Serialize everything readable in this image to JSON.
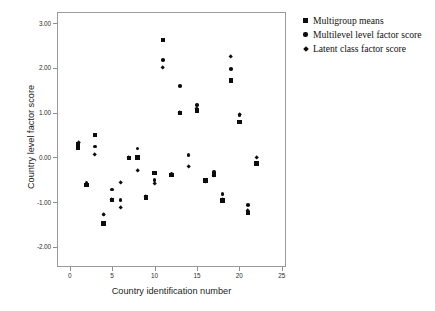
{
  "chart_data": {
    "type": "scatter",
    "title": "",
    "xlabel": "Country identification number",
    "ylabel": "Country level factor score",
    "xlim": [
      -1.5,
      25.5
    ],
    "ylim": [
      -2.45,
      3.25
    ],
    "xticks": [
      "0",
      "5",
      "10",
      "15",
      "20",
      "25"
    ],
    "xtick_values": [
      0,
      5,
      10,
      15,
      20,
      25
    ],
    "yticks": [
      "3.00",
      "2.00",
      "1.00",
      "0.00",
      "-1.00",
      "-2.00"
    ],
    "ytick_values": [
      3,
      2,
      1,
      0,
      -1,
      -2
    ],
    "grid": false,
    "legend_position": "outside-top-right",
    "series": [
      {
        "name": "Multigroup means",
        "marker": "square",
        "color": "#0d0d0d",
        "points": [
          {
            "x": 1,
            "y": 0.3
          },
          {
            "x": 1,
            "y": 0.22
          },
          {
            "x": 2,
            "y": -0.62
          },
          {
            "x": 3,
            "y": 0.5
          },
          {
            "x": 4,
            "y": -1.48
          },
          {
            "x": 5,
            "y": -0.95
          },
          {
            "x": 7,
            "y": -0.01
          },
          {
            "x": 8,
            "y": 0.0
          },
          {
            "x": 9,
            "y": -0.9
          },
          {
            "x": 10,
            "y": -0.35
          },
          {
            "x": 11,
            "y": 2.62
          },
          {
            "x": 12,
            "y": -0.39
          },
          {
            "x": 13,
            "y": 0.99
          },
          {
            "x": 15,
            "y": 1.05
          },
          {
            "x": 16,
            "y": -0.52
          },
          {
            "x": 17,
            "y": -0.38
          },
          {
            "x": 18,
            "y": -0.96
          },
          {
            "x": 19,
            "y": 1.72
          },
          {
            "x": 20,
            "y": 0.79
          },
          {
            "x": 21,
            "y": -1.24
          },
          {
            "x": 22,
            "y": -0.14
          }
        ]
      },
      {
        "name": "Multilevel level factor score",
        "marker": "circle",
        "color": "#0d0d0d",
        "points": [
          {
            "x": 1,
            "y": 0.27
          },
          {
            "x": 2,
            "y": -0.57
          },
          {
            "x": 3,
            "y": 0.24
          },
          {
            "x": 4,
            "y": -1.28
          },
          {
            "x": 5,
            "y": -0.72
          },
          {
            "x": 6,
            "y": -0.95
          },
          {
            "x": 7,
            "y": 0.0
          },
          {
            "x": 8,
            "y": 0.2
          },
          {
            "x": 9,
            "y": -0.88
          },
          {
            "x": 10,
            "y": -0.5
          },
          {
            "x": 11,
            "y": 2.18
          },
          {
            "x": 12,
            "y": -0.37
          },
          {
            "x": 13,
            "y": 1.6
          },
          {
            "x": 14,
            "y": 0.05
          },
          {
            "x": 15,
            "y": 1.17
          },
          {
            "x": 16,
            "y": -0.5
          },
          {
            "x": 17,
            "y": -0.33
          },
          {
            "x": 18,
            "y": -0.82
          },
          {
            "x": 19,
            "y": 1.97
          },
          {
            "x": 20,
            "y": 0.95
          },
          {
            "x": 21,
            "y": -1.06
          },
          {
            "x": 22,
            "y": -0.14
          }
        ]
      },
      {
        "name": "Latent class factor score",
        "marker": "diamond",
        "color": "#0d0d0d",
        "points": [
          {
            "x": 1,
            "y": 0.33
          },
          {
            "x": 2,
            "y": -0.6
          },
          {
            "x": 3,
            "y": 0.05
          },
          {
            "x": 4,
            "y": -1.28
          },
          {
            "x": 5,
            "y": -0.95
          },
          {
            "x": 6,
            "y": -0.57
          },
          {
            "x": 6,
            "y": -1.12
          },
          {
            "x": 7,
            "y": 0.0
          },
          {
            "x": 8,
            "y": -0.3
          },
          {
            "x": 9,
            "y": -0.88
          },
          {
            "x": 10,
            "y": -0.58
          },
          {
            "x": 11,
            "y": 2.01
          },
          {
            "x": 12,
            "y": -0.39
          },
          {
            "x": 13,
            "y": 0.99
          },
          {
            "x": 14,
            "y": -0.2
          },
          {
            "x": 15,
            "y": 1.09
          },
          {
            "x": 16,
            "y": -0.55
          },
          {
            "x": 17,
            "y": -0.42
          },
          {
            "x": 18,
            "y": -0.95
          },
          {
            "x": 19,
            "y": 2.26
          },
          {
            "x": 20,
            "y": 0.95
          },
          {
            "x": 21,
            "y": -1.2
          },
          {
            "x": 22,
            "y": 0.0
          }
        ]
      }
    ]
  },
  "legend": {
    "items": [
      {
        "label": "Multigroup means",
        "marker": "square"
      },
      {
        "label": "Multilevel level factor score",
        "marker": "circle"
      },
      {
        "label": "Latent class factor score",
        "marker": "diamond"
      }
    ]
  }
}
